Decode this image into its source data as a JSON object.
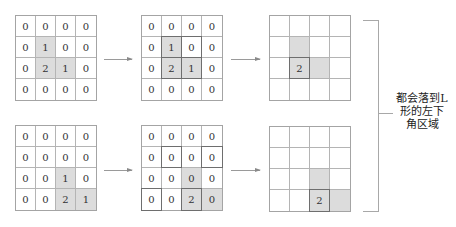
{
  "grids": [
    {
      "id": "g1",
      "cells": [
        [
          {
            "v": "0"
          },
          {
            "v": "0"
          },
          {
            "v": "0"
          },
          {
            "v": "0"
          }
        ],
        [
          {
            "v": "0"
          },
          {
            "v": "1",
            "shade": true
          },
          {
            "v": "0"
          },
          {
            "v": "0"
          }
        ],
        [
          {
            "v": "0"
          },
          {
            "v": "2",
            "shade": true
          },
          {
            "v": "1",
            "shade": true
          },
          {
            "v": "0"
          }
        ],
        [
          {
            "v": "0"
          },
          {
            "v": "0"
          },
          {
            "v": "0"
          },
          {
            "v": "0"
          }
        ]
      ]
    },
    {
      "id": "g2",
      "cells": [
        [
          {
            "v": "0"
          },
          {
            "v": "0"
          },
          {
            "v": "0"
          },
          {
            "v": "0"
          }
        ],
        [
          {
            "v": "0"
          },
          {
            "v": "1",
            "shade": true,
            "outline": true
          },
          {
            "v": "0",
            "outline": true
          },
          {
            "v": "0"
          }
        ],
        [
          {
            "v": "0"
          },
          {
            "v": "2",
            "shade": true,
            "outline": true
          },
          {
            "v": "1",
            "shade": true,
            "outline": true
          },
          {
            "v": "0"
          }
        ],
        [
          {
            "v": "0"
          },
          {
            "v": "0"
          },
          {
            "v": "0"
          },
          {
            "v": "0"
          }
        ]
      ]
    },
    {
      "id": "g3",
      "cells": [
        [
          {
            "v": ""
          },
          {
            "v": ""
          },
          {
            "v": ""
          },
          {
            "v": ""
          }
        ],
        [
          {
            "v": ""
          },
          {
            "v": "",
            "shade": true
          },
          {
            "v": ""
          },
          {
            "v": ""
          }
        ],
        [
          {
            "v": ""
          },
          {
            "v": "2",
            "shade": true,
            "outline": true
          },
          {
            "v": "",
            "shade": true
          },
          {
            "v": ""
          }
        ],
        [
          {
            "v": ""
          },
          {
            "v": ""
          },
          {
            "v": ""
          },
          {
            "v": ""
          }
        ]
      ]
    },
    {
      "id": "g4",
      "cells": [
        [
          {
            "v": "0"
          },
          {
            "v": "0"
          },
          {
            "v": "0"
          },
          {
            "v": "0"
          }
        ],
        [
          {
            "v": "0"
          },
          {
            "v": "0"
          },
          {
            "v": "0"
          },
          {
            "v": "0"
          }
        ],
        [
          {
            "v": "0"
          },
          {
            "v": "0"
          },
          {
            "v": "1",
            "shade": true
          },
          {
            "v": "0"
          }
        ],
        [
          {
            "v": "0"
          },
          {
            "v": "0"
          },
          {
            "v": "2",
            "shade": true
          },
          {
            "v": "1",
            "shade": true
          }
        ]
      ]
    },
    {
      "id": "g5",
      "cells": [
        [
          {
            "v": "0"
          },
          {
            "v": "0"
          },
          {
            "v": "0"
          },
          {
            "v": "0"
          }
        ],
        [
          {
            "v": "0"
          },
          {
            "v": "0",
            "outline": true
          },
          {
            "v": "0"
          },
          {
            "v": "0",
            "outline": true
          }
        ],
        [
          {
            "v": "0"
          },
          {
            "v": "0"
          },
          {
            "v": "0",
            "shade": true
          },
          {
            "v": "0"
          }
        ],
        [
          {
            "v": "0",
            "outline": true
          },
          {
            "v": "0"
          },
          {
            "v": "2",
            "shade": true,
            "outline": true
          },
          {
            "v": "0",
            "shade": true
          }
        ]
      ]
    },
    {
      "id": "g6",
      "cells": [
        [
          {
            "v": ""
          },
          {
            "v": ""
          },
          {
            "v": ""
          },
          {
            "v": ""
          }
        ],
        [
          {
            "v": ""
          },
          {
            "v": ""
          },
          {
            "v": ""
          },
          {
            "v": ""
          }
        ],
        [
          {
            "v": ""
          },
          {
            "v": ""
          },
          {
            "v": "",
            "shade": true
          },
          {
            "v": ""
          }
        ],
        [
          {
            "v": ""
          },
          {
            "v": ""
          },
          {
            "v": "2",
            "shade": true,
            "outline": true
          },
          {
            "v": "",
            "shade": true
          }
        ]
      ]
    }
  ],
  "annotation": {
    "lines": [
      "都会落到L",
      "形的左下",
      "角区域"
    ]
  },
  "colors": {
    "shade": "#dcdcdc",
    "grid_line": "#b4b4b4",
    "outline": "#6e6e6e"
  }
}
